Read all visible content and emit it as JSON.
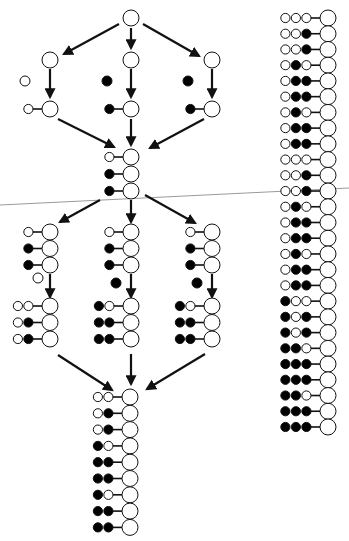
{
  "diagram": {
    "title": "",
    "legend": {
      "open": "white circle",
      "filled": "black circle"
    },
    "root": {
      "rows": [
        []
      ]
    },
    "stage1": [
      {
        "branch": "left",
        "added": "open",
        "rows": [
          [
            "open"
          ]
        ]
      },
      {
        "branch": "middle",
        "added": "filled",
        "rows": [
          [
            "filled"
          ]
        ]
      },
      {
        "branch": "right",
        "added": "filled",
        "rows": [
          [
            "filled"
          ]
        ]
      }
    ],
    "merge1": {
      "rows": [
        [
          "open"
        ],
        [
          "filled"
        ],
        [
          "filled"
        ]
      ]
    },
    "stage2": [
      {
        "branch": "left",
        "added": "open",
        "rows": [
          [
            "open",
            "open"
          ],
          [
            "open",
            "filled"
          ],
          [
            "open",
            "filled"
          ]
        ]
      },
      {
        "branch": "middle",
        "added": "filled",
        "rows": [
          [
            "filled",
            "open"
          ],
          [
            "filled",
            "filled"
          ],
          [
            "filled",
            "filled"
          ]
        ]
      },
      {
        "branch": "right",
        "added": "filled",
        "rows": [
          [
            "filled",
            "open"
          ],
          [
            "filled",
            "filled"
          ],
          [
            "filled",
            "filled"
          ]
        ]
      }
    ],
    "merge2": {
      "rows": [
        [
          "open",
          "open"
        ],
        [
          "open",
          "filled"
        ],
        [
          "open",
          "filled"
        ],
        [
          "filled",
          "open"
        ],
        [
          "filled",
          "filled"
        ],
        [
          "filled",
          "filled"
        ],
        [
          "filled",
          "open"
        ],
        [
          "filled",
          "filled"
        ],
        [
          "filled",
          "filled"
        ]
      ]
    },
    "final_column": {
      "rows": [
        [
          "open",
          "open",
          "open"
        ],
        [
          "open",
          "open",
          "filled"
        ],
        [
          "open",
          "open",
          "filled"
        ],
        [
          "open",
          "filled",
          "open"
        ],
        [
          "open",
          "filled",
          "filled"
        ],
        [
          "open",
          "filled",
          "filled"
        ],
        [
          "open",
          "filled",
          "open"
        ],
        [
          "open",
          "filled",
          "filled"
        ],
        [
          "open",
          "filled",
          "filled"
        ],
        [
          "open",
          "open",
          "open"
        ],
        [
          "open",
          "open",
          "filled"
        ],
        [
          "open",
          "open",
          "filled"
        ],
        [
          "open",
          "filled",
          "open"
        ],
        [
          "open",
          "filled",
          "filled"
        ],
        [
          "open",
          "filled",
          "filled"
        ],
        [
          "open",
          "filled",
          "open"
        ],
        [
          "open",
          "filled",
          "filled"
        ],
        [
          "open",
          "filled",
          "filled"
        ],
        [
          "filled",
          "open",
          "open"
        ],
        [
          "filled",
          "open",
          "filled"
        ],
        [
          "filled",
          "open",
          "filled"
        ],
        [
          "filled",
          "filled",
          "open"
        ],
        [
          "filled",
          "filled",
          "filled"
        ],
        [
          "filled",
          "filled",
          "filled"
        ],
        [
          "filled",
          "filled",
          "open"
        ],
        [
          "filled",
          "filled",
          "filled"
        ],
        [
          "filled",
          "filled",
          "filled"
        ]
      ]
    },
    "colors": {
      "stroke": "#111111",
      "fill_filled": "#000000",
      "fill_open": "#ffffff",
      "rule": "#9a9a9a"
    }
  }
}
